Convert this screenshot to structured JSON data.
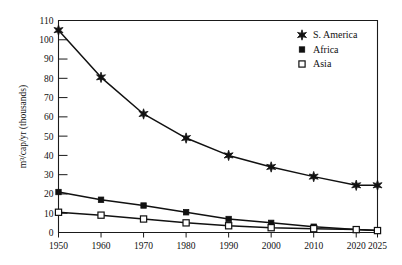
{
  "chart_data": {
    "type": "line",
    "title": "",
    "xlabel": "",
    "ylabel": "m³/cap/yr (thousands)",
    "x": [
      1950,
      1960,
      1970,
      1980,
      1990,
      2000,
      2010,
      2020,
      2025
    ],
    "xtick_labels": [
      "1950",
      "1960",
      "1970",
      "1980",
      "1990",
      "2000",
      "2010",
      "2020",
      "2025"
    ],
    "ytick_labels": [
      "0",
      "10",
      "20",
      "30",
      "40",
      "50",
      "60",
      "70",
      "80",
      "90",
      "100",
      "110"
    ],
    "yticks": [
      0,
      10,
      20,
      30,
      40,
      50,
      60,
      70,
      80,
      90,
      100,
      110
    ],
    "xlim": [
      1950,
      2025
    ],
    "ylim": [
      0,
      110
    ],
    "grid": false,
    "legend_position": "top-right",
    "series": [
      {
        "name": "S. America",
        "marker": "star",
        "color": "#111111",
        "values": [
          105,
          80.5,
          61.5,
          49,
          40,
          34,
          29,
          24.5,
          24.5
        ]
      },
      {
        "name": "Africa",
        "marker": "filled-square",
        "color": "#111111",
        "values": [
          21,
          17,
          14,
          10.5,
          7,
          5,
          3,
          1.5,
          1
        ]
      },
      {
        "name": "Asia",
        "marker": "open-square",
        "color": "#111111",
        "values": [
          10.5,
          9,
          7,
          5,
          3.5,
          2.5,
          2,
          1.5,
          1
        ]
      }
    ]
  },
  "legend": {
    "entries": [
      {
        "label": "S. America",
        "marker": "star-icon"
      },
      {
        "label": "Africa",
        "marker": "filled-square-icon"
      },
      {
        "label": "Asia",
        "marker": "open-square-icon"
      }
    ]
  },
  "axes": {
    "y_axis_title": "m³/cap/yr (thousands)"
  }
}
